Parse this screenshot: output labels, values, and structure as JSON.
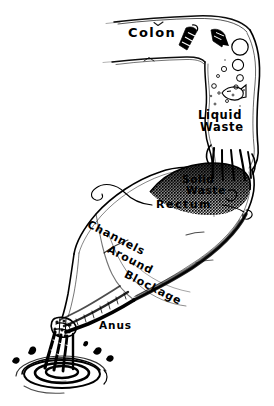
{
  "figure": {
    "style": "pen-and-ink line drawing",
    "ink_color": "#000000",
    "background_color": "#ffffff"
  },
  "labels": {
    "colon": "Colon",
    "liquid_waste_line1": "Liquid",
    "liquid_waste_line2": "Waste",
    "solid_waste_line1": "Solid",
    "solid_waste_line2": "Waste",
    "rectum": "Rectum",
    "channels": "Channels",
    "around": "Around",
    "blockage": "Blockage",
    "anus": "Anus"
  }
}
